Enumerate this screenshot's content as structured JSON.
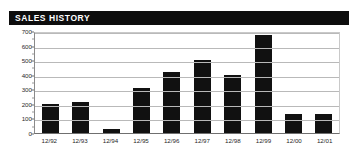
{
  "panel": {
    "title": "SALES HISTORY",
    "title_bar_color": "#0d0d0d",
    "title_text_color": "#ffffff",
    "background_color": "#ffffff"
  },
  "chart_data": {
    "type": "bar",
    "title": "SALES HISTORY",
    "xlabel": "",
    "ylabel": "",
    "categories": [
      "12/92",
      "12/93",
      "12/94",
      "12/95",
      "12/96",
      "12/97",
      "12/98",
      "12/99",
      "12/00",
      "12/01"
    ],
    "values": [
      200,
      215,
      25,
      310,
      420,
      500,
      400,
      675,
      130,
      130
    ],
    "ylim": [
      0,
      700
    ],
    "ytick_labels": [
      "700",
      "600",
      "500",
      "400",
      "300",
      "200",
      "100",
      "0"
    ],
    "ytick_values": [
      700,
      600,
      500,
      400,
      300,
      200,
      100,
      0
    ],
    "ytick_step": 100,
    "grid": true,
    "legend": false,
    "bar_color": "#111111",
    "grid_color": "#b9b9b9",
    "axis_color": "#6f6f6f"
  }
}
